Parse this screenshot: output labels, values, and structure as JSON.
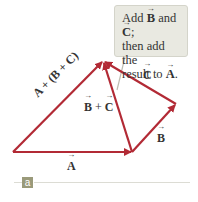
{
  "figure": {
    "panel_label": "a",
    "callout": {
      "line1_pre": "Add ",
      "line1_v1": "B",
      "line1_mid": " and ",
      "line1_v2": "C",
      "line1_post": ";",
      "line2": "then add the",
      "line3_pre": "result to ",
      "line3_v": "A",
      "line3_post": "."
    },
    "labels": {
      "A": "A",
      "B": "B",
      "C": "C",
      "BplusC_b": "B",
      "BplusC_op": " + ",
      "BplusC_c": "C",
      "sum": "A + (B + C)"
    },
    "colors": {
      "vector": "#b22a35",
      "callout_bg": "#e9e9e1",
      "tag_bg": "#9a9a7a"
    }
  }
}
